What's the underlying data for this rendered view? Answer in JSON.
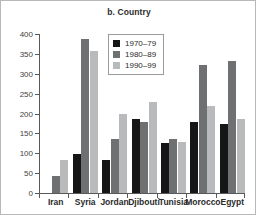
{
  "chart_data": {
    "type": "bar",
    "title": "b. Country",
    "subtitle": "",
    "xlabel": "",
    "ylabel": "",
    "ylim": [
      0,
      400
    ],
    "yticks": [
      0,
      50,
      100,
      150,
      200,
      250,
      300,
      350,
      400
    ],
    "ytick_labels": [
      "0",
      "50",
      "100",
      "150",
      "200",
      "250",
      "300",
      "350",
      "400"
    ],
    "grid": false,
    "legend_position": "upper-center",
    "categories": [
      "Iran",
      "Syria",
      "Jordan",
      "Djibouti",
      "Tunisia",
      "Morocco",
      "Egypt"
    ],
    "series": [
      {
        "name": "1970–79",
        "color": "#161616",
        "values": [
          0,
          99,
          82,
          185,
          126,
          178,
          173
        ]
      },
      {
        "name": "1980–89",
        "color": "#6f7072",
        "values": [
          42,
          388,
          135,
          178,
          137,
          321,
          331
        ]
      },
      {
        "name": "1990–99",
        "color": "#b9babc",
        "values": [
          82,
          357,
          199,
          230,
          128,
          219,
          187
        ]
      }
    ]
  }
}
